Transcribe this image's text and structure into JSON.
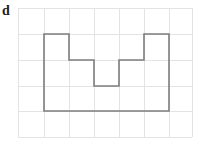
{
  "figure": {
    "label": "d",
    "background_color": "#ffffff"
  },
  "grid": {
    "line_color": "#e3e3e3",
    "line_width": 1,
    "x_lines": [
      18,
      44,
      69,
      94,
      119,
      144,
      169,
      192
    ],
    "y_lines": [
      8,
      34,
      60,
      86,
      111,
      137
    ],
    "cell_width": 25,
    "cell_height": 26,
    "columns": 7,
    "rows": 5
  },
  "chart_data": {
    "type": "diagram",
    "title": "d",
    "shape_name": "rectilinear-polygon",
    "stroke_color": "#7d7d7d",
    "stroke_width": 1.6,
    "fill": "none",
    "units": "grid-cells",
    "vertices_px": [
      [
        44,
        34
      ],
      [
        69,
        34
      ],
      [
        69,
        60
      ],
      [
        94,
        60
      ],
      [
        94,
        86
      ],
      [
        119,
        86
      ],
      [
        119,
        60
      ],
      [
        144,
        60
      ],
      [
        144,
        34
      ],
      [
        169,
        34
      ],
      [
        169,
        111
      ],
      [
        44,
        111
      ]
    ],
    "vertices_grid": [
      [
        1,
        1
      ],
      [
        2,
        1
      ],
      [
        2,
        2
      ],
      [
        3,
        2
      ],
      [
        3,
        3
      ],
      [
        4,
        3
      ],
      [
        4,
        2
      ],
      [
        5,
        2
      ],
      [
        5,
        1
      ],
      [
        6,
        1
      ],
      [
        6,
        4
      ],
      [
        1,
        4
      ]
    ],
    "bounding_box_grid": {
      "width": 5,
      "height": 3
    },
    "area_grid_cells": 12,
    "perimeter_grid_units": 20,
    "grid_on": true,
    "legend": "none"
  }
}
